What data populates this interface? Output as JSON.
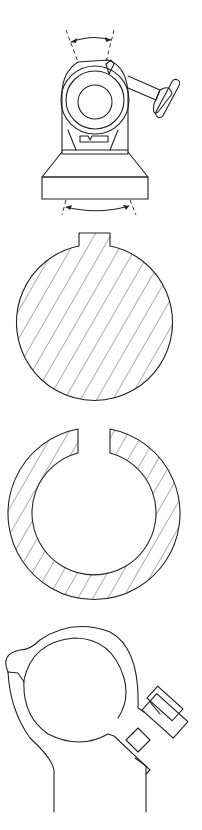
{
  "figure": {
    "background": "#ffffff",
    "line_color": "#222222",
    "panels": [
      {
        "id": "fig-a",
        "description": "mount assembly with rotating head, knob and base, double-headed rotation arrows above and below"
      },
      {
        "id": "fig-b",
        "description": "hatched solid circular cross-section with a key tab on top"
      },
      {
        "id": "fig-c",
        "description": "hatched split ring cross-section with a gap at the top"
      },
      {
        "id": "fig-d",
        "description": "split clamp collar with tightening screw on the right and stem below"
      }
    ]
  }
}
